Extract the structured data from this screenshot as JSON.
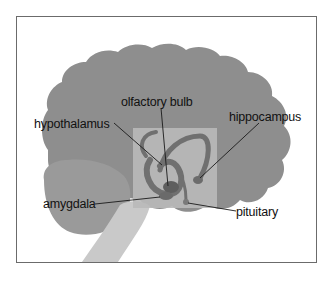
{
  "diagram": {
    "colors": {
      "cerebrum": "#8e8e8e",
      "cerebellum": "#9a9a9a",
      "brainstem": "#c9c9c9",
      "limbic_panel": "#b9b9b9",
      "limbic_structure": "#7a7a7a",
      "frame": "#6b6b6b",
      "leader_line": "#1a1a1a"
    },
    "labels": [
      {
        "id": "olfactory-bulb",
        "text": "olfactory bulb"
      },
      {
        "id": "hypothalamus",
        "text": "hypothalamus"
      },
      {
        "id": "hippocampus",
        "text": "hippocampus"
      },
      {
        "id": "amygdala",
        "text": "amygdala"
      },
      {
        "id": "pituitary",
        "text": "pituitary"
      }
    ]
  }
}
